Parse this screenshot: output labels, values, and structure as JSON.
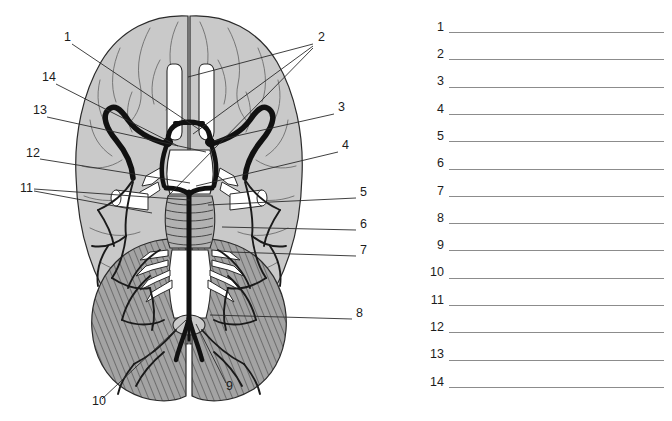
{
  "document": {
    "kind": "anatomy-labeling-worksheet",
    "subject": "Inferior view of the brain with arterial supply (Circle of Willis)"
  },
  "figure": {
    "colors": {
      "cerebrum_fill": "#c9c9c9",
      "cerebellum_fill": "#a3a3a3",
      "cerebellum_hatch": "#5c5c5c",
      "brainstem_fill": "#b2b2b2",
      "nerve_fill": "#ffffff",
      "artery_stroke": "#111111",
      "outline_stroke": "#2b2b2b",
      "vessel_stroke": "#1a1a1a",
      "leader_stroke": "#2b2b2b",
      "label_text": "#1c1c1c",
      "background": "#ffffff"
    },
    "callouts": [
      {
        "id": "1",
        "label": "1",
        "text_x": 64,
        "text_y": 41,
        "leaders": [
          [
            72,
            44,
            200,
            130
          ]
        ]
      },
      {
        "id": "2",
        "label": "2",
        "text_x": 318,
        "text_y": 41,
        "leaders": [
          [
            313,
            44,
            188,
            77
          ],
          [
            313,
            46,
            193,
            134
          ],
          [
            313,
            48,
            168,
            196
          ]
        ]
      },
      {
        "id": "3",
        "label": "3",
        "text_x": 338,
        "text_y": 111,
        "leaders": [
          [
            334,
            114,
            214,
            141
          ]
        ]
      },
      {
        "id": "4",
        "label": "4",
        "text_x": 342,
        "text_y": 149,
        "leaders": [
          [
            338,
            152,
            196,
            186
          ]
        ]
      },
      {
        "id": "5",
        "label": "5",
        "text_x": 360,
        "text_y": 196,
        "leaders": [
          [
            356,
            198,
            208,
            205
          ]
        ]
      },
      {
        "id": "6",
        "label": "6",
        "text_x": 360,
        "text_y": 228,
        "leaders": [
          [
            356,
            230,
            222,
            227
          ]
        ]
      },
      {
        "id": "7",
        "label": "7",
        "text_x": 360,
        "text_y": 254,
        "leaders": [
          [
            356,
            256,
            230,
            252
          ]
        ]
      },
      {
        "id": "8",
        "label": "8",
        "text_x": 356,
        "text_y": 317,
        "leaders": [
          [
            352,
            319,
            210,
            315
          ]
        ]
      },
      {
        "id": "9",
        "label": "9",
        "text_x": 226,
        "text_y": 390,
        "leaders": [
          [
            226,
            383,
            196,
            324
          ]
        ]
      },
      {
        "id": "10",
        "label": "10",
        "text_x": 92,
        "text_y": 405,
        "leaders": [
          [
            102,
            399,
            186,
            320
          ]
        ]
      },
      {
        "id": "11",
        "label": "11",
        "text_x": 20,
        "text_y": 192,
        "leaders": [
          [
            34,
            189,
            190,
            200
          ],
          [
            34,
            191,
            152,
            213
          ]
        ]
      },
      {
        "id": "12",
        "label": "12",
        "text_x": 26,
        "text_y": 157,
        "leaders": [
          [
            40,
            159,
            190,
            183
          ]
        ]
      },
      {
        "id": "13",
        "label": "13",
        "text_x": 33,
        "text_y": 114,
        "leaders": [
          [
            47,
            117,
            206,
            152
          ]
        ]
      },
      {
        "id": "14",
        "label": "14",
        "text_x": 42,
        "text_y": 81,
        "leaders": [
          [
            56,
            84,
            178,
            146
          ]
        ]
      }
    ]
  },
  "answer_key": {
    "rows": [
      {
        "number": "1"
      },
      {
        "number": "2"
      },
      {
        "number": "3"
      },
      {
        "number": "4"
      },
      {
        "number": "5"
      },
      {
        "number": "6"
      },
      {
        "number": "7"
      },
      {
        "number": "8"
      },
      {
        "number": "9"
      },
      {
        "number": "10"
      },
      {
        "number": "11"
      },
      {
        "number": "12"
      },
      {
        "number": "13"
      },
      {
        "number": "14"
      }
    ],
    "line_color": "#8c8c8c",
    "first_row_y": 17,
    "row_spacing": 27.3
  }
}
